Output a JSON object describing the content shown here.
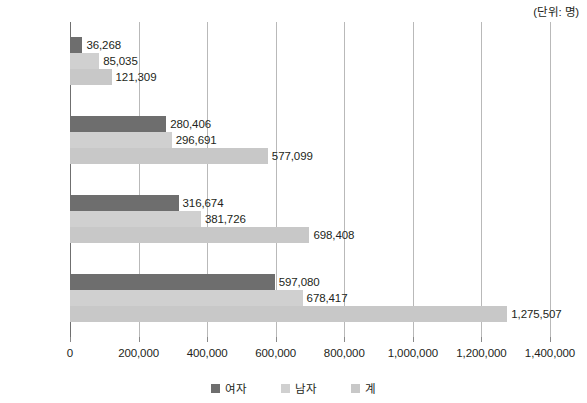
{
  "unit_note": "(단위: 명)",
  "legend": {
    "position": "bottom-center",
    "items": [
      {
        "label": "여자",
        "color": "#6e6e6e"
      },
      {
        "label": "남자",
        "color": "#d0d0d0"
      },
      {
        "label": "계",
        "color": "#c8c8c8"
      }
    ]
  },
  "chart_data": {
    "type": "bar",
    "orientation": "horizontal",
    "title": "",
    "subtitle": "",
    "xlabel": "",
    "ylabel": "",
    "unit": "(단위: 명)",
    "grid": true,
    "xlim": [
      0,
      1400000
    ],
    "xticks": [
      0,
      200000,
      400000,
      600000,
      800000,
      1000000,
      1200000,
      1400000
    ],
    "xtick_labels": [
      "0",
      "200,000",
      "400,000",
      "600,000",
      "800,000",
      "1,000,000",
      "1,200,000",
      "1,400,000"
    ],
    "categories": [
      "국제순이동",
      "출국자",
      "입국자",
      "총이동"
    ],
    "series": [
      {
        "name": "여자",
        "color": "#6e6e6e",
        "values": [
          36268,
          280406,
          316674,
          597080
        ],
        "labels": [
          "36,268",
          "280,406",
          "316,674",
          "597,080"
        ]
      },
      {
        "name": "남자",
        "color": "#d0d0d0",
        "values": [
          85035,
          296691,
          381726,
          678417
        ],
        "labels": [
          "85,035",
          "296,691",
          "381,726",
          "678,417"
        ]
      },
      {
        "name": "계",
        "color": "#c8c8c8",
        "values": [
          121309,
          577099,
          698408,
          1275507
        ],
        "labels": [
          "121,309",
          "577,099",
          "698,408",
          "1,275,507"
        ]
      }
    ]
  }
}
